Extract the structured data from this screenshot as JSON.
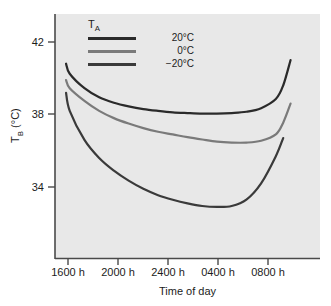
{
  "chart_data": {
    "type": "line",
    "title": "",
    "xlabel": "Time of day",
    "ylabel": "T_B (°C)",
    "ylabel_base": "T",
    "ylabel_sub": "B",
    "ylabel_unit": " (°C)",
    "grid": false,
    "legend_position": "top-left-inside",
    "legend_title": "T_A",
    "legend_title_base": "T",
    "legend_title_sub": "A",
    "xlim": [
      1500,
      900
    ],
    "ylim": [
      30.1,
      43.5
    ],
    "xtick_labels": [
      "1600 h",
      "2000 h",
      "2400 h",
      "0400 h",
      "0800 h"
    ],
    "ytick_labels": [
      "42",
      "38",
      "34"
    ],
    "ytick_values": [
      42,
      38,
      34
    ],
    "series": [
      {
        "name": "20°C",
        "color": "#2a2a2a",
        "x": [
          1545,
          1600,
          1700,
          1800,
          1900,
          2000,
          2100,
          2200,
          2300,
          2400,
          100,
          200,
          300,
          400,
          500,
          600,
          630,
          700
        ],
        "values": [
          40.8,
          40.25,
          39.45,
          38.95,
          38.65,
          38.45,
          38.3,
          38.2,
          38.12,
          38.08,
          38.05,
          38.05,
          38.08,
          38.15,
          38.35,
          38.85,
          39.6,
          41.0
        ]
      },
      {
        "name": "0°C",
        "color": "#7a7a7a",
        "x": [
          1545,
          1600,
          1700,
          1800,
          1900,
          2000,
          2100,
          2200,
          2300,
          2400,
          100,
          200,
          300,
          400,
          500,
          600,
          630,
          700
        ],
        "values": [
          39.9,
          39.45,
          38.75,
          38.2,
          37.8,
          37.5,
          37.25,
          37.05,
          36.9,
          36.75,
          36.62,
          36.5,
          36.45,
          36.45,
          36.55,
          36.9,
          37.55,
          38.6
        ]
      },
      {
        "name": "−20°C",
        "color": "#3a3a3a",
        "x": [
          1545,
          1600,
          1700,
          1800,
          1900,
          2000,
          2100,
          2200,
          2300,
          2400,
          100,
          200,
          300,
          400,
          500,
          600,
          630
        ],
        "values": [
          39.2,
          38.2,
          36.6,
          35.6,
          34.9,
          34.35,
          33.9,
          33.55,
          33.3,
          33.1,
          32.95,
          32.9,
          32.95,
          33.3,
          34.2,
          35.7,
          36.7
        ]
      }
    ]
  },
  "axes": {
    "y_ticks": [
      {
        "label": "42",
        "top": 36
      },
      {
        "label": "38",
        "top": 108
      },
      {
        "label": "34",
        "top": 181
      }
    ],
    "x_ticks": [
      {
        "label": "1600 h",
        "left": 39
      },
      {
        "label": "2000 h",
        "left": 89
      },
      {
        "label": "2400 h",
        "left": 139
      },
      {
        "label": "0400 h",
        "left": 189
      },
      {
        "label": "0800 h",
        "left": 239
      }
    ]
  }
}
